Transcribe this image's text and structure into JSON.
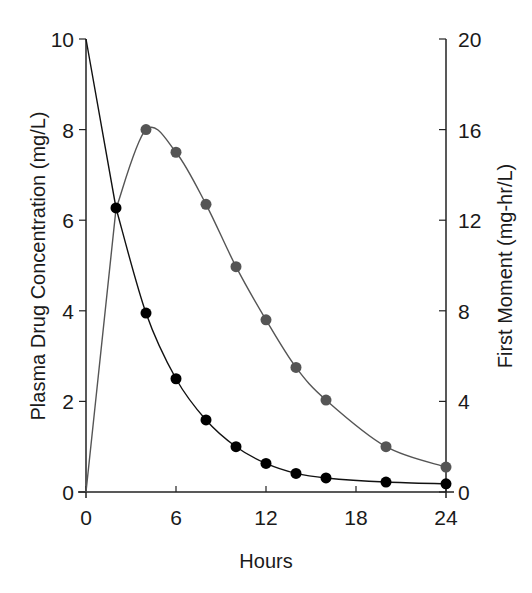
{
  "chart_data": {
    "type": "line",
    "title": "",
    "xlabel": "Hours",
    "ylabel": "Plasma Drug Concentration (mg/L)",
    "y2label": "First Moment (mg-hr/L)",
    "xlim": [
      0,
      24
    ],
    "ylim": [
      0,
      10
    ],
    "y2lim": [
      0,
      20
    ],
    "x_ticks": [
      "0",
      "6",
      "12",
      "18",
      "24"
    ],
    "y_ticks": [
      "0",
      "2",
      "4",
      "6",
      "8",
      "10"
    ],
    "y2_ticks": [
      "0",
      "4",
      "8",
      "12",
      "16",
      "20"
    ],
    "grid": false,
    "legend": null,
    "series": [
      {
        "name": "Plasma Drug Concentration",
        "axis": "left",
        "color": "#111111",
        "marker_color": "#000000",
        "x": [
          0,
          2,
          4,
          6,
          8,
          10,
          12,
          14,
          16,
          20,
          24
        ],
        "values": [
          10,
          6.27,
          3.95,
          2.5,
          1.59,
          1.0,
          0.63,
          0.41,
          0.31,
          0.22,
          0.18
        ],
        "markers_at": [
          2,
          4,
          6,
          8,
          10,
          12,
          14,
          16,
          20,
          24
        ]
      },
      {
        "name": "First Moment",
        "axis": "right",
        "color": "#555555",
        "marker_color": "#555555",
        "x": [
          0,
          2,
          4,
          6,
          8,
          10,
          12,
          14,
          16,
          20,
          24
        ],
        "values": [
          0,
          12.5,
          16.0,
          15.0,
          12.7,
          9.95,
          7.6,
          5.5,
          4.06,
          2.0,
          1.1
        ],
        "markers_at": [
          4,
          6,
          8,
          10,
          12,
          14,
          16,
          20,
          24
        ]
      }
    ]
  }
}
